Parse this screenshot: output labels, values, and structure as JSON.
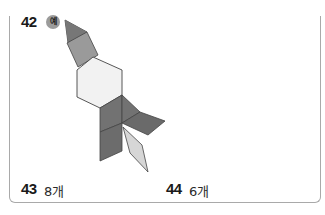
{
  "problems": [
    {
      "number": "42",
      "badge": "예",
      "type": "example-figure"
    },
    {
      "number": "43",
      "answer": "8개"
    },
    {
      "number": "44",
      "answer": "6개"
    }
  ],
  "figure": {
    "colors": {
      "dark_gray": "#6e6e6e",
      "mid_gray": "#8a8a8a",
      "light_gray": "#a3a3a3",
      "hexagon": "#f2f2f2",
      "thin_rhombus": "#d4d4d4",
      "outline": "#444444"
    }
  }
}
